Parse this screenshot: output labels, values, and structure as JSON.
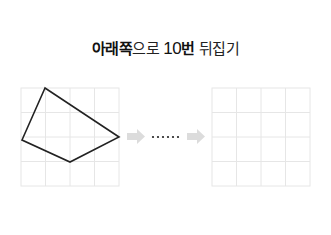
{
  "title": {
    "bold_part": "아래쪽",
    "normal_part": "으로 ",
    "number": "10",
    "bold_suffix": "번",
    "rest": " 뒤집기"
  },
  "left_grid": {
    "rows": 4,
    "cols": 4,
    "x": 21,
    "y": 88,
    "cell": 24.5
  },
  "right_grid": {
    "rows": 4,
    "cols": 4,
    "x": 212,
    "y": 88,
    "cell": 24.5
  },
  "shape": {
    "points": "45,88 22,140 70,162 119,137"
  },
  "connector": {
    "dots": "......"
  },
  "colors": {
    "grid": "#e6e6e6",
    "shape": "#222222",
    "arrow": "#dcdcdc"
  }
}
